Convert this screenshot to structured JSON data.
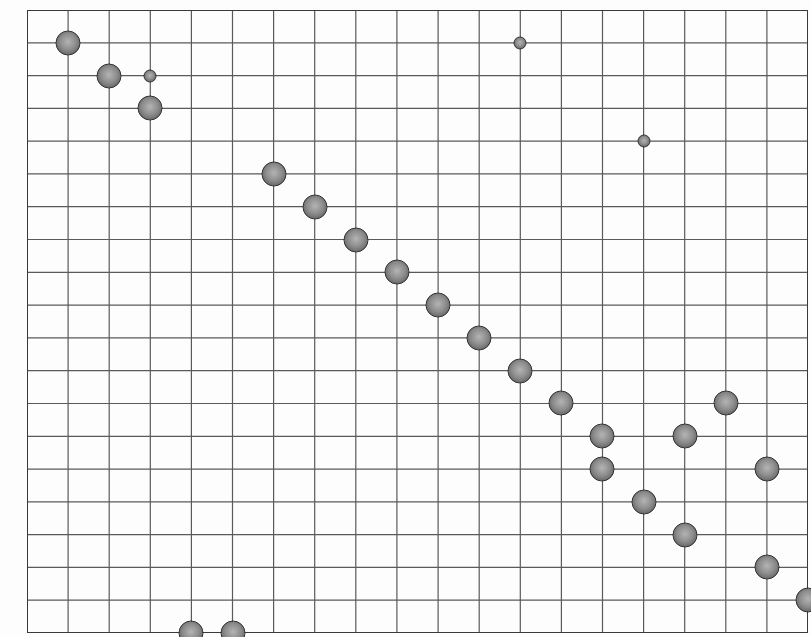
{
  "board": {
    "columns": 19,
    "rows": 19,
    "origin_px": {
      "x": 27,
      "y": 10
    },
    "size_px": {
      "width": 781,
      "height": 623
    },
    "line_color": "#5a5a5a",
    "border_color": "#3a3a3a",
    "background_color": "#fdfdfd"
  },
  "stones": [
    {
      "col": 1,
      "row": 1,
      "size": "large"
    },
    {
      "col": 2,
      "row": 2,
      "size": "large"
    },
    {
      "col": 3,
      "row": 2,
      "size": "small"
    },
    {
      "col": 3,
      "row": 3,
      "size": "large"
    },
    {
      "col": 12,
      "row": 1,
      "size": "small"
    },
    {
      "col": 15,
      "row": 4,
      "size": "small"
    },
    {
      "col": 6,
      "row": 5,
      "size": "large"
    },
    {
      "col": 7,
      "row": 6,
      "size": "large"
    },
    {
      "col": 8,
      "row": 7,
      "size": "large"
    },
    {
      "col": 9,
      "row": 8,
      "size": "large"
    },
    {
      "col": 10,
      "row": 9,
      "size": "large"
    },
    {
      "col": 11,
      "row": 10,
      "size": "large"
    },
    {
      "col": 12,
      "row": 11,
      "size": "large"
    },
    {
      "col": 13,
      "row": 12,
      "size": "large"
    },
    {
      "col": 17,
      "row": 12,
      "size": "large"
    },
    {
      "col": 14,
      "row": 13,
      "size": "large"
    },
    {
      "col": 16,
      "row": 13,
      "size": "large"
    },
    {
      "col": 14,
      "row": 14,
      "size": "large"
    },
    {
      "col": 18,
      "row": 14,
      "size": "large"
    },
    {
      "col": 15,
      "row": 15,
      "size": "large"
    },
    {
      "col": 16,
      "row": 16,
      "size": "large"
    },
    {
      "col": 18,
      "row": 17,
      "size": "large"
    },
    {
      "col": 19,
      "row": 18,
      "size": "large"
    },
    {
      "col": 4,
      "row": 19,
      "size": "large"
    },
    {
      "col": 5,
      "row": 19,
      "size": "large"
    }
  ],
  "stone_colors": {
    "highlight": "#b4b4b4",
    "body": "#8e8e8e",
    "shadow": "#5e5e5e",
    "outline": "#2e2e2e"
  }
}
